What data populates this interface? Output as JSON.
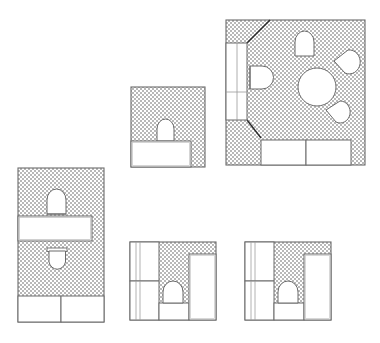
{
  "sheet": {
    "title": "Bathroom Plan Layouts",
    "width": 380,
    "height": 343,
    "background_color": "#ffffff",
    "line_color": "#6b6b6b",
    "dark_line_color": "#2b2b2b",
    "hatch_color": "#b4b4b4",
    "fixture_fill": "#ffffff",
    "drawing_type": "architectural-floor-plan",
    "plan_count": 5
  },
  "plans": [
    {
      "id": "plan-left-tall",
      "label": "Plan A",
      "bounds": {
        "x": 18,
        "y": 168,
        "w": 86,
        "h": 154
      },
      "fixtures": [
        "toilet",
        "toilet",
        "bathtub",
        "counter",
        "counter"
      ]
    },
    {
      "id": "plan-top-middle",
      "label": "Plan B",
      "bounds": {
        "x": 131,
        "y": 87,
        "w": 74,
        "h": 80
      },
      "fixtures": [
        "toilet",
        "bathtub"
      ]
    },
    {
      "id": "plan-top-right",
      "label": "Plan C",
      "bounds": {
        "x": 226,
        "y": 20,
        "w": 139,
        "h": 145
      },
      "fixtures": [
        "toilet",
        "sink-round",
        "sink-corner",
        "sink-corner",
        "bathtub",
        "counter",
        "counter",
        "counter"
      ]
    },
    {
      "id": "plan-bottom-middle",
      "label": "Plan D",
      "bounds": {
        "x": 130,
        "y": 242,
        "w": 86,
        "h": 78
      },
      "fixtures": [
        "toilet",
        "bathtub",
        "counter",
        "counter"
      ]
    },
    {
      "id": "plan-bottom-right",
      "label": "Plan E",
      "bounds": {
        "x": 245,
        "y": 242,
        "w": 86,
        "h": 78
      },
      "fixtures": [
        "toilet",
        "bathtub",
        "counter",
        "counter"
      ]
    }
  ]
}
